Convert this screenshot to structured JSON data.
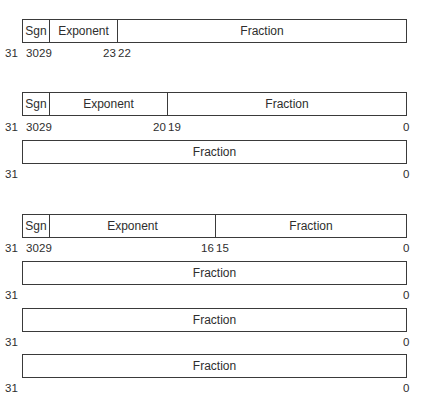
{
  "formats": [
    {
      "name": "single-precision",
      "rows": [
        {
          "fields": [
            {
              "label": "Sgn",
              "x0": 0,
              "x1": 27
            },
            {
              "label": "Exponent",
              "x0": 27,
              "x1": 95
            },
            {
              "label": "Fraction",
              "x0": 95,
              "x1": 385
            }
          ],
          "bits": [
            {
              "text": "31",
              "x": 5
            },
            {
              "text": "30",
              "x": 26
            },
            {
              "text": "29",
              "x": 39
            },
            {
              "text": "23",
              "x": 103
            },
            {
              "text": "22",
              "x": 118
            }
          ]
        }
      ]
    },
    {
      "name": "double-precision",
      "rows": [
        {
          "fields": [
            {
              "label": "Sgn",
              "x0": 0,
              "x1": 27
            },
            {
              "label": "Exponent",
              "x0": 27,
              "x1": 145
            },
            {
              "label": "Fraction",
              "x0": 145,
              "x1": 385
            }
          ],
          "bits": [
            {
              "text": "31",
              "x": 5
            },
            {
              "text": "30",
              "x": 26
            },
            {
              "text": "29",
              "x": 39
            },
            {
              "text": "20",
              "x": 153
            },
            {
              "text": "19",
              "x": 168
            },
            {
              "text": "0",
              "x": 403
            }
          ]
        },
        {
          "fields": [
            {
              "label": "Fraction",
              "x0": 0,
              "x1": 385
            }
          ],
          "bits": [
            {
              "text": "31",
              "x": 5
            },
            {
              "text": "0",
              "x": 403
            }
          ]
        }
      ]
    },
    {
      "name": "extended-precision",
      "rows": [
        {
          "fields": [
            {
              "label": "Sgn",
              "x0": 0,
              "x1": 27
            },
            {
              "label": "Exponent",
              "x0": 27,
              "x1": 193
            },
            {
              "label": "Fraction",
              "x0": 193,
              "x1": 385
            }
          ],
          "bits": [
            {
              "text": "31",
              "x": 5
            },
            {
              "text": "30",
              "x": 26
            },
            {
              "text": "29",
              "x": 39
            },
            {
              "text": "16",
              "x": 201
            },
            {
              "text": "15",
              "x": 216
            },
            {
              "text": "0",
              "x": 403
            }
          ]
        },
        {
          "fields": [
            {
              "label": "Fraction",
              "x0": 0,
              "x1": 385
            }
          ],
          "bits": [
            {
              "text": "31",
              "x": 5
            },
            {
              "text": "0",
              "x": 403
            }
          ]
        },
        {
          "fields": [
            {
              "label": "Fraction",
              "x0": 0,
              "x1": 385
            }
          ],
          "bits": [
            {
              "text": "31",
              "x": 5
            },
            {
              "text": "0",
              "x": 403
            }
          ]
        },
        {
          "fields": [
            {
              "label": "Fraction",
              "x0": 0,
              "x1": 385
            }
          ],
          "bits": [
            {
              "text": "31",
              "x": 5
            },
            {
              "text": "0",
              "x": 403
            }
          ]
        }
      ]
    }
  ]
}
